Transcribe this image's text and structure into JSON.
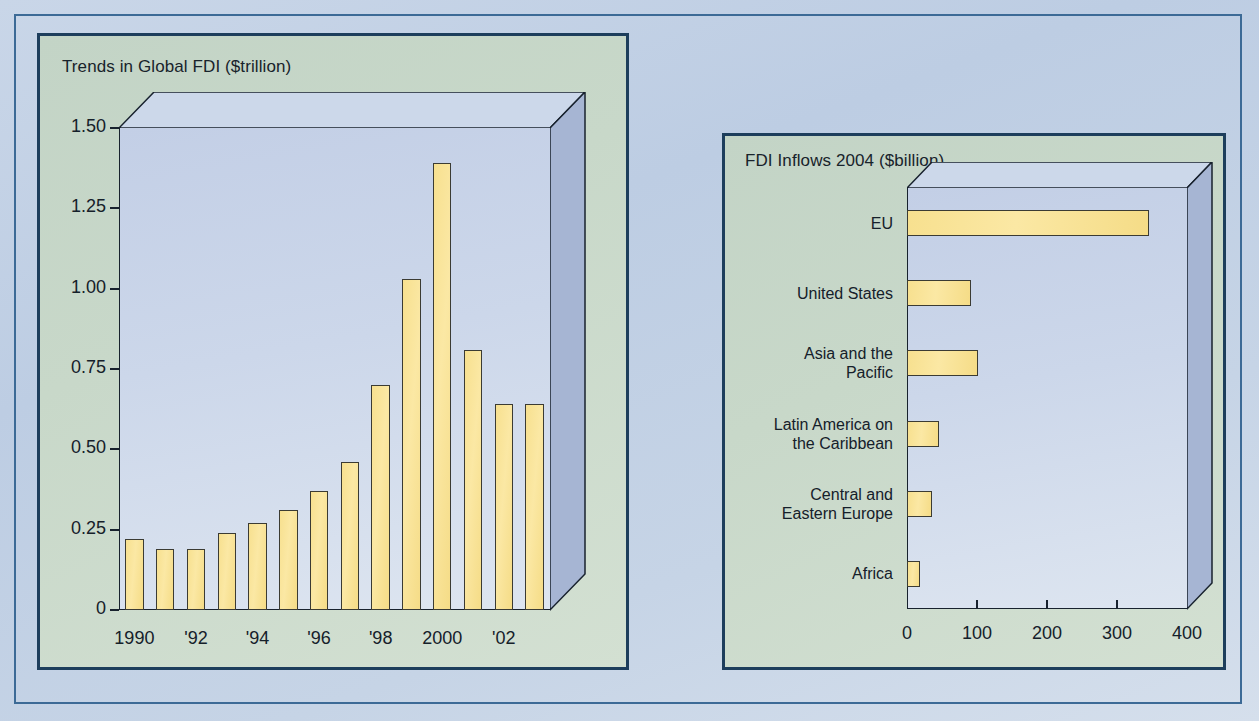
{
  "figure": {
    "colors": {
      "background": "#c6d4e6",
      "outer_border": "#3c6a96",
      "panel_background": "#cbdacb",
      "panel_border": "#1d3e5c",
      "bar_fill": "#f7e08f",
      "bar_border": "#3b3b33",
      "plot_face": "#ccd7ea",
      "plot_top": "#d2dcec",
      "plot_side": "#a3b3d1",
      "text": "#15202a"
    }
  },
  "chart_data": [
    {
      "type": "bar",
      "id": "trends-global-fdi",
      "title": "Trends in Global FDI ($trillion)",
      "xlabel": "",
      "ylabel": "",
      "orientation": "vertical",
      "grid": false,
      "legend": null,
      "ylim": [
        0,
        1.5
      ],
      "ytick_labels": [
        "0",
        "0.25",
        "0.50",
        "0.75",
        "1.00",
        "1.25",
        "1.50"
      ],
      "ytick_values": [
        0,
        0.25,
        0.5,
        0.75,
        1.0,
        1.25,
        1.5
      ],
      "xtick_labels": [
        "1990",
        "'92",
        "'94",
        "'96",
        "'98",
        "2000",
        "'02"
      ],
      "xtick_years": [
        1990,
        1992,
        1994,
        1996,
        1998,
        2000,
        2002
      ],
      "categories": [
        1990,
        1991,
        1992,
        1993,
        1994,
        1995,
        1996,
        1997,
        1998,
        1999,
        2000,
        2001,
        2002,
        2003
      ],
      "values": [
        0.22,
        0.19,
        0.19,
        0.24,
        0.27,
        0.31,
        0.37,
        0.46,
        0.7,
        1.03,
        1.39,
        0.81,
        0.64,
        0.64
      ]
    },
    {
      "type": "bar",
      "id": "fdi-inflows-2004",
      "title": "FDI Inflows 2004 ($billion)",
      "xlabel": "",
      "ylabel": "",
      "orientation": "horizontal",
      "grid": false,
      "legend": null,
      "xlim": [
        0,
        400
      ],
      "xtick_labels": [
        "0",
        "100",
        "200",
        "300",
        "400"
      ],
      "xtick_values": [
        0,
        100,
        200,
        300,
        400
      ],
      "categories": [
        "EU",
        "United States",
        "Asia and the\nPacific",
        "Latin America on\nthe Caribbean",
        "Central and\nEastern Europe",
        "Africa"
      ],
      "values": [
        345,
        91,
        101,
        46,
        36,
        18
      ]
    }
  ]
}
